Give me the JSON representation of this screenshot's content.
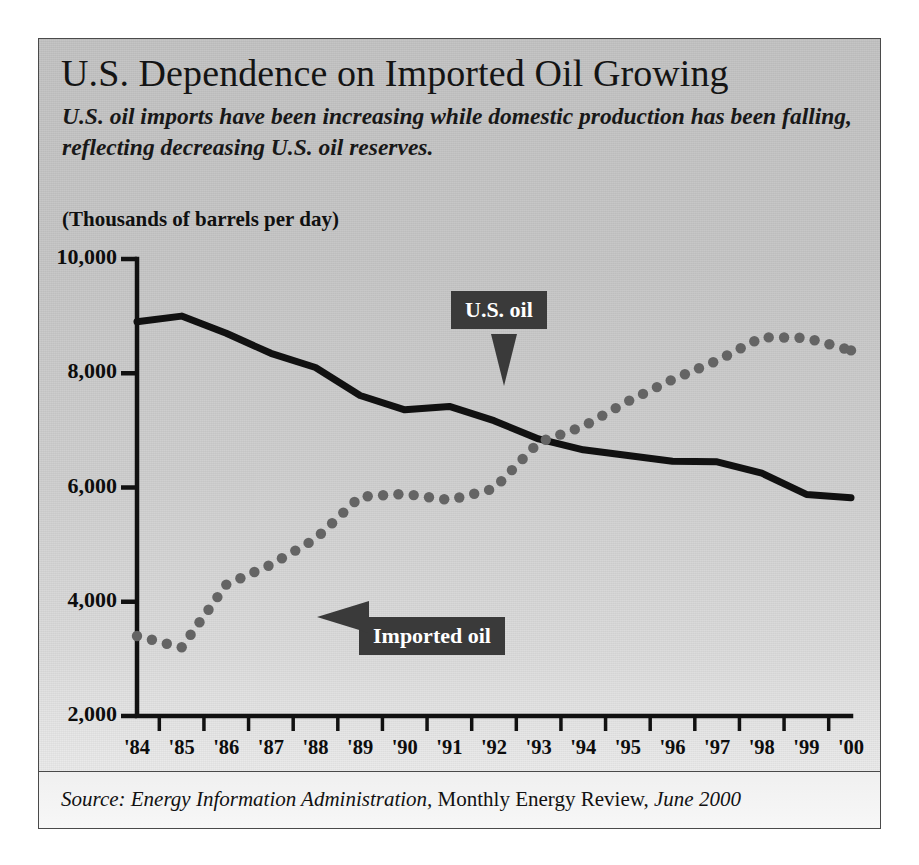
{
  "figure": {
    "title": "U.S. Dependence on Imported Oil Growing",
    "subtitle": "U.S. oil imports have been increasing while domestic production has been falling, reflecting decreasing U.S. oil reserves.",
    "units_label": "(Thousands of barrels per day)",
    "source": {
      "prefix_italic": "Source: Energy Information Administration,",
      "middle_roman": " Monthly Energy Review,",
      "suffix_italic": " June 2000"
    },
    "callouts": {
      "us_oil": "U.S. oil",
      "imported_oil": "Imported oil"
    },
    "colors": {
      "panel_bg": "#cfcfcf",
      "panel_border": "#4a4a4a",
      "us_oil_line": "#111111",
      "imported_oil_dots": "#646464",
      "callout_bg": "#3a3a3a",
      "callout_text": "#ffffff",
      "axis": "#111111",
      "text": "#111111"
    }
  },
  "chart_data": {
    "type": "line",
    "title": "U.S. Dependence on Imported Oil Growing",
    "subtitle": "U.S. oil imports have been increasing while domestic production has been falling, reflecting decreasing U.S. oil reserves.",
    "xlabel": "",
    "ylabel": "(Thousands of barrels per day)",
    "ylim": [
      2000,
      10000
    ],
    "ytick_labels": [
      "10,000",
      "8,000",
      "6,000",
      "4,000",
      "2,000"
    ],
    "ytick_values": [
      10000,
      8000,
      6000,
      4000,
      2000
    ],
    "grid": false,
    "legend_position": "inline-callouts",
    "categories": [
      "'84",
      "'85",
      "'86",
      "'87",
      "'88",
      "'89",
      "'90",
      "'91",
      "'92",
      "'93",
      "'94",
      "'95",
      "'96",
      "'97",
      "'98",
      "'99",
      "'00"
    ],
    "series": [
      {
        "name": "U.S. oil",
        "style": "solid",
        "color": "#111111",
        "values": [
          8900,
          9000,
          8700,
          8350,
          8100,
          7610,
          7360,
          7420,
          7170,
          6850,
          6660,
          6560,
          6460,
          6450,
          6250,
          5880,
          5820
        ]
      },
      {
        "name": "Imported oil",
        "style": "dotted",
        "color": "#646464",
        "values": [
          3400,
          3200,
          4300,
          4650,
          5100,
          5840,
          5890,
          5780,
          5980,
          6790,
          7070,
          7510,
          7890,
          8220,
          8630,
          8620,
          8400
        ]
      }
    ],
    "annotations": [
      {
        "text": "U.S. oil",
        "points_to_series": "U.S. oil"
      },
      {
        "text": "Imported oil",
        "points_to_series": "Imported oil"
      }
    ],
    "source": "Source: Energy Information Administration, Monthly Energy Review, June 2000"
  }
}
